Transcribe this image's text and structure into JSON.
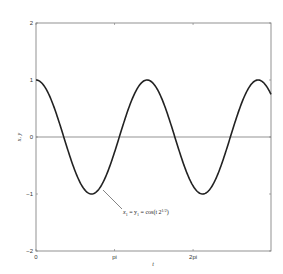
{
  "chart_data": {
    "type": "line",
    "title": "",
    "xlabel": "t",
    "ylabel": "x, y",
    "xlim": [
      0,
      9.4
    ],
    "ylim": [
      -2,
      2
    ],
    "grid": false,
    "x_ticks": [
      {
        "value": 0,
        "label": "0"
      },
      {
        "value": 3.14159,
        "label": "pi"
      },
      {
        "value": 6.28319,
        "label": "2pi"
      }
    ],
    "y_ticks": [
      {
        "value": -2,
        "label": "−2"
      },
      {
        "value": -1,
        "label": "−1"
      },
      {
        "value": 0,
        "label": "0"
      },
      {
        "value": 1,
        "label": "1"
      },
      {
        "value": 2,
        "label": "2"
      }
    ],
    "series": [
      {
        "name": "x1 = y1 = cos(t 2^(1/2))",
        "function": "cos(sqrt(2)*t)",
        "color": "#222222",
        "x": [
          0,
          1.11,
          2.22,
          3.33,
          4.44,
          5.55,
          6.66,
          7.77,
          8.89,
          9.4
        ],
        "values": [
          1.0,
          0.0,
          -1.0,
          0.0,
          1.0,
          0.0,
          -1.0,
          0.0,
          1.0,
          0.75
        ]
      }
    ],
    "reference_lines": [
      {
        "axis": "y",
        "value": 0,
        "color": "#666666"
      }
    ],
    "annotations": [
      {
        "text_main": "x",
        "sub1": "1",
        "eq1": " = y",
        "sub2": "1",
        "eq2": " = cos(t 2",
        "sup": "1/2",
        "close": ")",
        "points_to": {
          "x": 2.6,
          "y": -0.9
        }
      }
    ]
  },
  "colors": {
    "curve": "#222222",
    "axes": "#777777",
    "zero_line": "#666666",
    "background": "#ffffff"
  }
}
